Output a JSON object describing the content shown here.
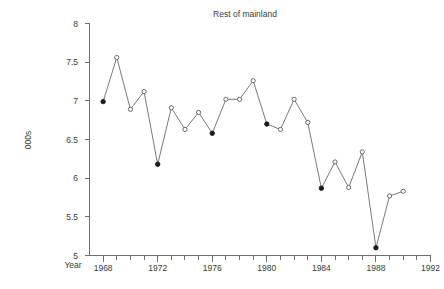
{
  "chart_data": {
    "type": "line",
    "title": "Rest of mainland",
    "xlabel": "Year",
    "ylabel": "000s",
    "xlim": [
      1967,
      1992
    ],
    "ylim": [
      5,
      8
    ],
    "grid": false,
    "legend": "none",
    "x": [
      1968,
      1969,
      1970,
      1971,
      1972,
      1973,
      1974,
      1975,
      1976,
      1977,
      1978,
      1979,
      1980,
      1981,
      1982,
      1983,
      1984,
      1985,
      1986,
      1987,
      1988,
      1989,
      1990
    ],
    "values": [
      6.99,
      7.56,
      6.89,
      7.12,
      6.18,
      6.91,
      6.63,
      6.85,
      6.58,
      7.02,
      7.02,
      7.26,
      6.7,
      6.63,
      7.02,
      6.72,
      5.87,
      6.21,
      5.88,
      6.34,
      5.1,
      5.77,
      5.83
    ],
    "marker_styles": [
      "filled",
      "open",
      "open",
      "open",
      "filled",
      "open",
      "open",
      "open",
      "filled",
      "open",
      "open",
      "open",
      "filled",
      "open",
      "open",
      "open",
      "filled",
      "open",
      "open",
      "open",
      "filled",
      "open",
      "open"
    ],
    "x_tick_labels": [
      "1968",
      "1972",
      "1976",
      "1980",
      "1984",
      "1988",
      "1992"
    ],
    "x_tick_values": [
      1968,
      1972,
      1976,
      1980,
      1984,
      1988,
      1992
    ],
    "x_minor_step": 1,
    "y_tick_labels": [
      "8",
      "7.5",
      "7",
      "6.5",
      "6",
      "5.5",
      "5"
    ],
    "y_tick_values": [
      8,
      7.5,
      7,
      6.5,
      6,
      5.5,
      5
    ],
    "colors": {
      "line": "#6a6a6a",
      "marker_open_fill": "#ffffff",
      "marker_stroke": "#5a5a5a",
      "marker_filled": "#1a1a1a",
      "axis": "#6e6e6e",
      "text": "#3a3a3a",
      "background": "#ffffff"
    }
  }
}
